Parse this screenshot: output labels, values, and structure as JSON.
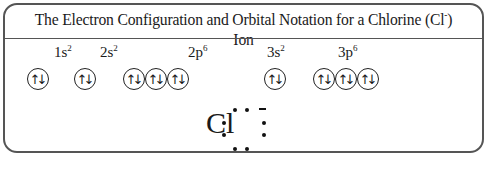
{
  "title": "The Electron Configuration and Orbital Notation for a Chlorine (Cl",
  "title_sup": "-",
  "title_end": ") Ion",
  "sublevels": [
    {
      "label": "1s",
      "exp": "2",
      "orbitals": 1
    },
    {
      "label": "2s",
      "exp": "2",
      "orbitals": 1
    },
    {
      "label": "2p",
      "exp": "6",
      "orbitals": 3
    },
    {
      "label": "3s",
      "exp": "2",
      "orbitals": 1
    },
    {
      "label": "3p",
      "exp": "6",
      "orbitals": 3
    }
  ],
  "orbital_symbol": "↑↓",
  "lewis": {
    "symbol": "Cl",
    "charge": "-",
    "dots": 8
  }
}
